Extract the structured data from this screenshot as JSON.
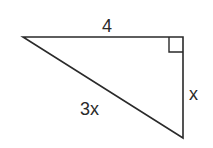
{
  "diagram": {
    "type": "right-triangle",
    "labels": {
      "top_side": "4",
      "right_side": "x",
      "hypotenuse": "3x"
    },
    "right_angle_marker": "top-right vertex",
    "stroke_color": "#2a2a2a",
    "background": "#ffffff"
  }
}
